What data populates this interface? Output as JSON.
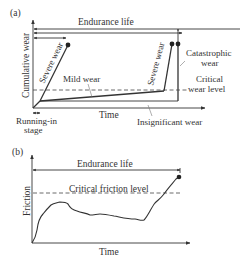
{
  "panel_a": {
    "label": "(a)",
    "y_axis_label": "Cumulative wear",
    "x_axis_label": "Time",
    "endurance_label": "Endurance life",
    "curves": {
      "severe_1": "Severe wear",
      "severe_2": "Severe wear",
      "mild": "Mild wear"
    },
    "annotations": {
      "catastrophic_line1": "Catastrophic",
      "catastrophic_line2": "wear",
      "critical_line1": "Critical",
      "critical_line2": "wear level",
      "insignificant": "Insignificant wear",
      "running_in_line1": "Running-in",
      "running_in_line2": "stage"
    }
  },
  "panel_b": {
    "label": "(b)",
    "y_axis_label": "Friction",
    "x_axis_label": "Time",
    "endurance_label": "Endurance life",
    "critical_label": "Critical friction level"
  },
  "colors": {
    "line": "#333333",
    "background": "#ffffff"
  }
}
